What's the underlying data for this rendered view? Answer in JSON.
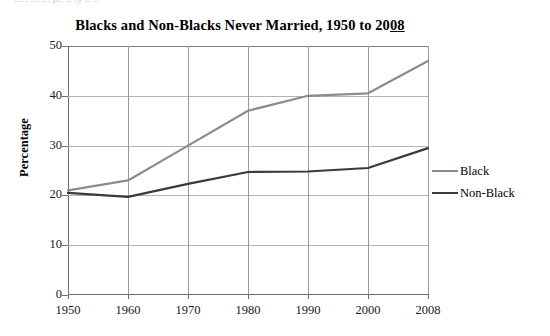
{
  "page": {
    "clipped_top_text": "..... ... ... p.. .. .y .. ..",
    "background": "#ffffff"
  },
  "chart_data": {
    "type": "line",
    "title": "Blacks and Non-Blacks Never Married, 1950 to 2008",
    "title_underlined_suffix": "08",
    "title_prefix": "Blacks and Non-Blacks Never Married, 1950 to 20",
    "xlabel": "",
    "ylabel": "Percentage",
    "categories": [
      "1950",
      "1960",
      "1970",
      "1980",
      "1990",
      "2000",
      "2008"
    ],
    "ylim": [
      0,
      50
    ],
    "yticks": [
      0,
      10,
      20,
      30,
      40,
      50
    ],
    "ytick_labels": [
      "0",
      "10",
      "20",
      "30",
      "40",
      "50"
    ],
    "grid": true,
    "legend_position": "right",
    "series": [
      {
        "name": "Black",
        "color": "#8c8c8c",
        "values": [
          21,
          23,
          30,
          37,
          40,
          40.5,
          47
        ]
      },
      {
        "name": "Non-Black",
        "color": "#3a3a3a",
        "values": [
          20.5,
          19.7,
          22.3,
          24.7,
          24.8,
          25.5,
          29.5
        ]
      }
    ]
  },
  "axis_colors": {
    "frame": "#6e6e6e",
    "hgrid": "#b4b4b4",
    "vgrid": "#9a9a9a"
  }
}
